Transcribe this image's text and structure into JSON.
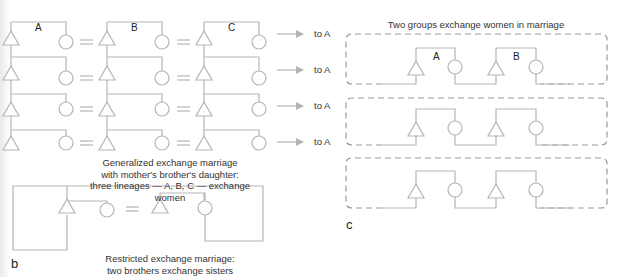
{
  "panel_b": {
    "label": "b",
    "generalized": {
      "lineages": [
        "A",
        "B",
        "C"
      ],
      "arrow_targets": [
        "to A",
        "to A",
        "to A",
        "to A"
      ],
      "caption_lines": [
        "Generalized exchange marriage",
        "with mother's brother's daughter:",
        "three lineages — A, B, C — exchange",
        "women"
      ]
    },
    "restricted": {
      "caption_lines": [
        "Restricted exchange marriage:",
        "two brothers exchange sisters"
      ]
    }
  },
  "panel_c": {
    "label": "c",
    "title": "Two groups exchange women in marriage",
    "groups": [
      "A",
      "B"
    ],
    "box_count": 3
  },
  "colors": {
    "line": "#b5b5b5",
    "dashed": "#9a9a9a",
    "text": "#222222"
  },
  "symbols": {
    "male": "triangle",
    "female": "circle",
    "marriage": "equals-sign"
  }
}
